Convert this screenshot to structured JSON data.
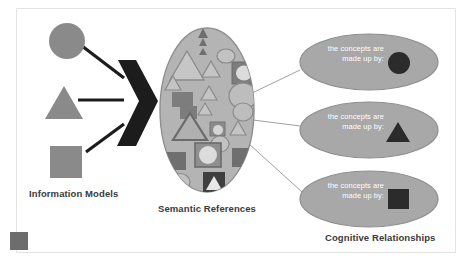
{
  "figure": {
    "background_color": "#ffffff",
    "frame_color": "#e3e3e3"
  },
  "captions": {
    "information_models": "Information Models",
    "semantic_references": "Semantic References",
    "cognitive_relationships": "Cognitive Relationships"
  },
  "colors": {
    "shape_gray": "#8a8a8a",
    "ellipse_fill": "#b4b4b4",
    "ellipse_stroke": "#8e8e8e",
    "cloud_fill": "#a8a8a8",
    "cloud_stroke": "#8a8a8a",
    "arrow_black": "#1c1c1c",
    "connector": "#9a9a9a",
    "text_dark": "#3a3a3a",
    "text_white": "#ffffff",
    "icon_gray": "#6d6d6d"
  },
  "source_shapes": [
    {
      "name": "circle",
      "label": "circle-shape"
    },
    {
      "name": "triangle",
      "label": "triangle-shape"
    },
    {
      "name": "square",
      "label": "square-shape"
    }
  ],
  "arrow": {
    "name": "chevron-arrow",
    "direction": "right"
  },
  "semantic_cloud": {
    "name": "semantic-references-ellipse",
    "shape_count": 26
  },
  "bubbles": [
    {
      "text": "the concepts are\nmade up by:",
      "glyph": "circle",
      "glyph_name": "dark-circle-glyph"
    },
    {
      "text": "the concepts are\nmade up by:",
      "glyph": "triangle",
      "glyph_name": "dark-triangle-glyph"
    },
    {
      "text": "the concepts are\nmade up by:",
      "glyph": "square",
      "glyph_name": "dark-square-glyph"
    }
  ],
  "toolbar": {
    "expand_icon": "expand-icon"
  }
}
